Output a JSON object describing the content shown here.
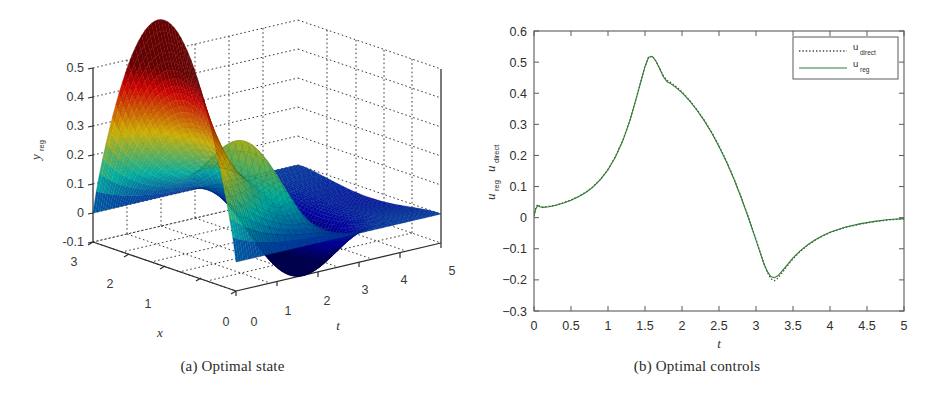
{
  "figure": {
    "panels": [
      {
        "id": "a",
        "caption": "(a) Optimal state",
        "type": "surface3d"
      },
      {
        "id": "b",
        "caption": "(b) Optimal controls",
        "type": "line"
      }
    ]
  },
  "chart_data": [
    {
      "type": "surface",
      "panel": "a",
      "title": "",
      "xlabel": "x",
      "ylabel": "t",
      "zlabel": "y_reg",
      "zlabel_base": "y",
      "zlabel_sub": "reg",
      "xlim": [
        0,
        3
      ],
      "ylim": [
        0,
        5
      ],
      "zlim": [
        -0.1,
        0.5
      ],
      "xticks": [
        3,
        2,
        1,
        0
      ],
      "yticks": [
        0,
        1,
        2,
        3,
        4,
        5
      ],
      "zticks": [
        0.5,
        0.4,
        0.3,
        0.2,
        0.1,
        0,
        -0.1
      ],
      "xtick_labels": [
        "3",
        "2",
        "1",
        "0"
      ],
      "ytick_labels": [
        "0",
        "1",
        "2",
        "3",
        "4",
        "5"
      ],
      "ztick_labels": [
        "0.5",
        "0.4",
        "0.3",
        "0.2",
        "0.1",
        "0",
        "-0.1"
      ],
      "grid": true,
      "grid_style": "dotted",
      "colormap": "jet",
      "description": "Mesh surface of the regularized optimal state y_reg(x,t): large positive ridge peaking near 0.55 at t~0 for small x, a secondary red spike near t=2, and a deep negative trough (~-0.1) near t=3 decaying toward t=5.",
      "features": [
        {
          "name": "main-ridge-peak",
          "t": 0.0,
          "x": 3.0,
          "z": 0.55
        },
        {
          "name": "secondary-spike",
          "t": 2.0,
          "x": 3.0,
          "z": 0.27
        },
        {
          "name": "negative-trough",
          "t": 3.0,
          "x": 0.0,
          "z": -0.13
        }
      ]
    },
    {
      "type": "line",
      "panel": "b",
      "title": "",
      "xlabel": "t",
      "ylabel": "u_reg, u_direct",
      "ylabel_parts": [
        {
          "base": "u",
          "sub": "reg"
        },
        {
          "base": "u",
          "sub": "direct"
        }
      ],
      "xlim": [
        0,
        5
      ],
      "ylim": [
        -0.3,
        0.6
      ],
      "xticks": [
        0,
        0.5,
        1,
        1.5,
        2,
        2.5,
        3,
        3.5,
        4,
        4.5,
        5
      ],
      "yticks": [
        0.6,
        0.5,
        0.4,
        0.3,
        0.2,
        0.1,
        0,
        -0.1,
        -0.2,
        -0.3
      ],
      "xtick_labels": [
        "0",
        "0.5",
        "1",
        "1.5",
        "2",
        "2.5",
        "3",
        "3.5",
        "4",
        "4.5",
        "5"
      ],
      "ytick_labels": [
        "0.6",
        "0.5",
        "0.4",
        "0.3",
        "0.2",
        "0.1",
        "0",
        "-0.1",
        "-0.2",
        "-0.3"
      ],
      "grid": false,
      "legend_position": "upper-right",
      "legend": [
        {
          "label": "u_direct",
          "base": "u",
          "sub": "direct",
          "style": "dotted",
          "color": "#4a4a4a"
        },
        {
          "label": "u_reg",
          "base": "u",
          "sub": "reg",
          "style": "solid",
          "color": "#2e7d32"
        }
      ],
      "series": [
        {
          "name": "u_direct",
          "style": "dotted",
          "color": "#4a4a4a",
          "x": [
            0,
            0.02,
            0.05,
            0.08,
            0.12,
            0.2,
            0.3,
            0.4,
            0.5,
            0.6,
            0.7,
            0.8,
            0.9,
            1.0,
            1.1,
            1.2,
            1.3,
            1.4,
            1.5,
            1.55,
            1.6,
            1.65,
            1.7,
            1.75,
            1.8,
            1.85,
            1.9,
            2.0,
            2.1,
            2.2,
            2.3,
            2.4,
            2.5,
            2.6,
            2.7,
            2.8,
            2.9,
            3.0,
            3.1,
            3.15,
            3.2,
            3.25,
            3.3,
            3.4,
            3.5,
            3.6,
            3.7,
            3.8,
            3.9,
            4.0,
            4.2,
            4.4,
            4.6,
            4.8,
            5.0
          ],
          "y": [
            0.005,
            0.028,
            0.042,
            0.036,
            0.034,
            0.036,
            0.041,
            0.048,
            0.057,
            0.068,
            0.082,
            0.1,
            0.124,
            0.155,
            0.196,
            0.248,
            0.316,
            0.4,
            0.487,
            0.517,
            0.519,
            0.503,
            0.479,
            0.455,
            0.441,
            0.434,
            0.425,
            0.404,
            0.378,
            0.348,
            0.314,
            0.275,
            0.231,
            0.182,
            0.127,
            0.066,
            0.0,
            -0.07,
            -0.142,
            -0.174,
            -0.196,
            -0.203,
            -0.194,
            -0.162,
            -0.132,
            -0.108,
            -0.088,
            -0.072,
            -0.059,
            -0.048,
            -0.032,
            -0.021,
            -0.013,
            -0.007,
            -0.004
          ]
        },
        {
          "name": "u_reg",
          "style": "solid",
          "color": "#2e7d32",
          "x": [
            0,
            0.02,
            0.05,
            0.08,
            0.12,
            0.2,
            0.3,
            0.4,
            0.5,
            0.6,
            0.7,
            0.8,
            0.9,
            1.0,
            1.1,
            1.2,
            1.3,
            1.4,
            1.5,
            1.55,
            1.6,
            1.65,
            1.7,
            1.75,
            1.8,
            1.85,
            1.9,
            2.0,
            2.1,
            2.2,
            2.3,
            2.4,
            2.5,
            2.6,
            2.7,
            2.8,
            2.9,
            3.0,
            3.1,
            3.15,
            3.2,
            3.25,
            3.3,
            3.4,
            3.5,
            3.6,
            3.7,
            3.8,
            3.9,
            4.0,
            4.2,
            4.4,
            4.6,
            4.8,
            5.0
          ],
          "y": [
            0.004,
            0.026,
            0.04,
            0.035,
            0.033,
            0.035,
            0.04,
            0.047,
            0.056,
            0.067,
            0.081,
            0.099,
            0.123,
            0.154,
            0.195,
            0.247,
            0.315,
            0.399,
            0.486,
            0.516,
            0.518,
            0.502,
            0.478,
            0.452,
            0.437,
            0.43,
            0.422,
            0.402,
            0.376,
            0.346,
            0.312,
            0.273,
            0.229,
            0.18,
            0.125,
            0.064,
            -0.002,
            -0.072,
            -0.144,
            -0.172,
            -0.189,
            -0.193,
            -0.186,
            -0.158,
            -0.129,
            -0.106,
            -0.087,
            -0.071,
            -0.058,
            -0.047,
            -0.031,
            -0.02,
            -0.012,
            -0.006,
            -0.003
          ]
        }
      ]
    }
  ]
}
